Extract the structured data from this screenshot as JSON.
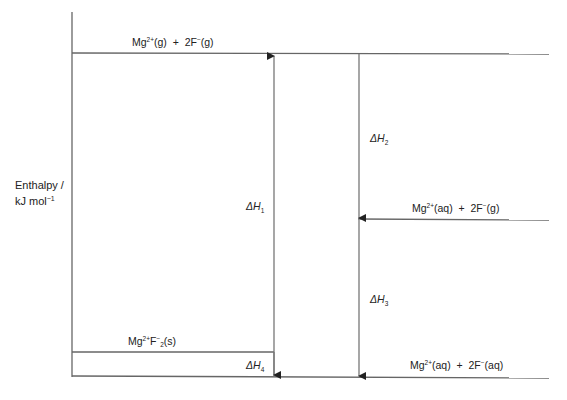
{
  "diagram": {
    "type": "enthalpy-cycle",
    "axis": {
      "label_line1": "Enthalpy /",
      "label_line2_main": "kJ mol",
      "label_line2_sup": "−1"
    },
    "levels": {
      "top": {
        "mg": "Mg",
        "mg_charge": "2+",
        "mg_state": "(g)",
        "plus": "+",
        "f": "2F",
        "f_charge": "−",
        "f_state": "(g)"
      },
      "middle": {
        "mg": "Mg",
        "mg_charge": "2+",
        "mg_state": "(aq)",
        "plus": "+",
        "f": "2F",
        "f_charge": "−",
        "f_state": "(g)"
      },
      "lattice": {
        "mg": "Mg",
        "mg_charge": "2+",
        "f": "F",
        "f_charge": "−",
        "f_sub": "2",
        "state": "(s)"
      },
      "bottom": {
        "mg": "Mg",
        "mg_charge": "2+",
        "mg_state": "(aq)",
        "plus": "+",
        "f": "2F",
        "f_charge": "−",
        "f_state": "(aq)"
      }
    },
    "enthalpy_changes": [
      {
        "symbol": "ΔH",
        "sub": "1",
        "direction": "up"
      },
      {
        "symbol": "ΔH",
        "sub": "2",
        "direction": "down"
      },
      {
        "symbol": "ΔH",
        "sub": "3",
        "direction": "down"
      },
      {
        "symbol": "ΔH",
        "sub": "4",
        "direction": "down"
      }
    ],
    "colors": {
      "line": "#555555",
      "text": "#222222"
    }
  }
}
